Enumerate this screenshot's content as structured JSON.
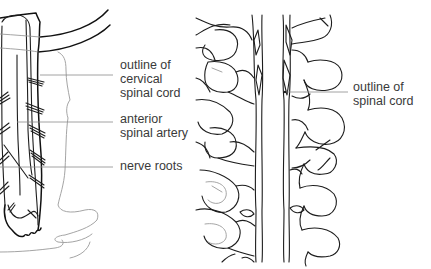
{
  "figure": {
    "panels": [
      {
        "id": "left",
        "subject": "cervical spinal cord (lateral view)",
        "labels": [
          {
            "lines": [
              "outline of",
              "cervical",
              "spinal cord"
            ],
            "x": 120,
            "y": 58
          },
          {
            "lines": [
              "anterior",
              "spinal artery"
            ],
            "x": 120,
            "y": 112
          },
          {
            "lines": [
              "nerve roots"
            ],
            "x": 120,
            "y": 159
          }
        ]
      },
      {
        "id": "right",
        "subject": "spinal cord within vertebral column (posterior view)",
        "labels": [
          {
            "lines": [
              "outline of",
              "spinal cord"
            ],
            "x": 353,
            "y": 80
          }
        ]
      }
    ],
    "colors": {
      "background": "#ffffff",
      "ink": "#1d1d1d",
      "faint_ink": "#9a9a9a",
      "leader": "#8a8a8a",
      "text": "#3a3a3a"
    }
  }
}
